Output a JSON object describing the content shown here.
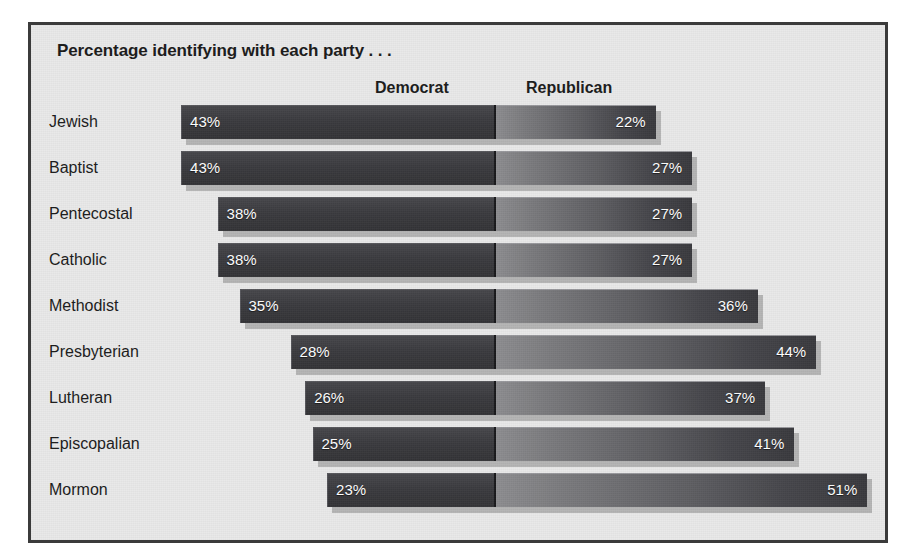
{
  "chart_data": {
    "type": "bar",
    "subtype": "diverging-horizontal-stacked",
    "title": "Percentage identifying with each party . . .",
    "xlabel": "",
    "ylabel": "",
    "grid": false,
    "legend_position": "top",
    "value_suffix": "%",
    "axis_center_percent": 0,
    "categories": [
      "Jewish",
      "Baptist",
      "Pentecostal",
      "Catholic",
      "Methodist",
      "Presbyterian",
      "Lutheran",
      "Episcopalian",
      "Mormon"
    ],
    "series": [
      {
        "name": "Democrat",
        "side": "left",
        "color": "#3a3a3e",
        "values": [
          43,
          43,
          38,
          38,
          35,
          28,
          26,
          25,
          23
        ],
        "labels": [
          "43%",
          "43%",
          "38%",
          "38%",
          "35%",
          "28%",
          "26%",
          "25%",
          "23%"
        ]
      },
      {
        "name": "Republican",
        "side": "right",
        "color": "#6a6a6e",
        "values": [
          22,
          27,
          27,
          27,
          36,
          44,
          37,
          41,
          51
        ],
        "labels": [
          "22%",
          "27%",
          "27%",
          "27%",
          "36%",
          "44%",
          "37%",
          "41%",
          "51%"
        ]
      }
    ],
    "rows": [
      {
        "label": "Jewish",
        "democrat": 43,
        "democrat_label": "43%",
        "republican": 22,
        "republican_label": "22%"
      },
      {
        "label": "Baptist",
        "democrat": 43,
        "democrat_label": "43%",
        "republican": 27,
        "republican_label": "27%"
      },
      {
        "label": "Pentecostal",
        "democrat": 38,
        "democrat_label": "38%",
        "republican": 27,
        "republican_label": "27%"
      },
      {
        "label": "Catholic",
        "democrat": 38,
        "democrat_label": "38%",
        "republican": 27,
        "republican_label": "27%"
      },
      {
        "label": "Methodist",
        "democrat": 35,
        "democrat_label": "35%",
        "republican": 36,
        "republican_label": "36%"
      },
      {
        "label": "Presbyterian",
        "democrat": 28,
        "democrat_label": "28%",
        "republican": 44,
        "republican_label": "44%"
      },
      {
        "label": "Lutheran",
        "democrat": 26,
        "democrat_label": "26%",
        "republican": 37,
        "republican_label": "37%"
      },
      {
        "label": "Episcopalian",
        "democrat": 25,
        "democrat_label": "25%",
        "republican": 41,
        "republican_label": "41%"
      },
      {
        "label": "Mormon",
        "democrat": 23,
        "democrat_label": "23%",
        "republican": 51,
        "republican_label": "51%"
      }
    ]
  },
  "legend": {
    "democrat": "Democrat",
    "republican": "Republican"
  },
  "colors": {
    "panel_background": "#e9e9e9",
    "frame_border": "#3b3b3b",
    "democrat_bar": "#3a3a3e",
    "republican_bar": "#6a6a6e",
    "value_text": "#ffffff",
    "label_text": "#1a1a1a"
  },
  "layout": {
    "center_x": 464,
    "px_per_percent": 7.3,
    "first_row_top": 80,
    "row_pitch": 46
  }
}
